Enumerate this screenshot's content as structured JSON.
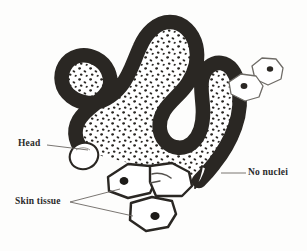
{
  "figure": {
    "background_color": "#fdfdfc",
    "ink_color": "#2a2723",
    "light_ink_color": "#6e6b66",
    "leader_color": "#6b6762"
  },
  "labels": {
    "head": "Head",
    "skin_tissue": "Skin tissue",
    "no_nuclei": "No nuclei"
  },
  "annotations": [
    {
      "id": "head",
      "text": "Head",
      "text_x": 18,
      "text_y": 139,
      "leader_from": [
        47,
        145
      ],
      "leader_to": [
        88,
        150
      ]
    },
    {
      "id": "skin-tissue",
      "text": "Skin tissue",
      "text_x": 15,
      "text_y": 197,
      "leader_from": [
        70,
        202
      ],
      "leader_to_upper": [
        120,
        189
      ],
      "leader_to_lower": [
        133,
        216
      ]
    },
    {
      "id": "no-nuclei",
      "text": "No nuclei",
      "text_x": 248,
      "text_y": 168,
      "leader_from": [
        246,
        173
      ],
      "leader_to": [
        221,
        173
      ]
    }
  ],
  "structures": {
    "worm": {
      "name": "worm-body",
      "band_width": 13,
      "outline_color": "#2a2723",
      "fill_color": "#ffffff",
      "speckle_color": "#2a2723",
      "speckle_count": 168,
      "head_shape": "rounded-bulb",
      "tail_shape": "tapered-point",
      "head_has_speckles": false,
      "tail_has_speckles": false
    },
    "free_cells": {
      "name": "free-cells-upper-right",
      "count": 2,
      "outline_color": "#6e6b66",
      "nucleus_color": "#2a2723",
      "nuclei_per_cell": 1
    },
    "skin_cells": {
      "name": "skin-tissue-cells",
      "count": 3,
      "outline_color": "#2a2723",
      "nucleus_color": "#1d1b18",
      "nuclei_visible": 2
    }
  }
}
